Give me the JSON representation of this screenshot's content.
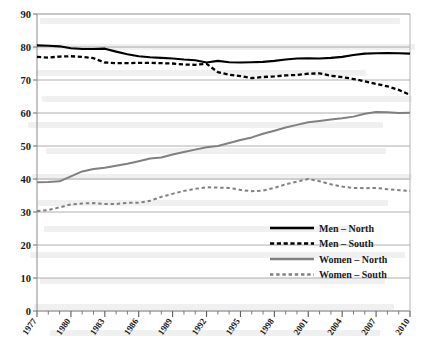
{
  "chart_data": {
    "type": "line",
    "title": "",
    "xlabel": "",
    "ylabel": "",
    "xlim": [
      1977,
      2010
    ],
    "ylim": [
      0,
      90
    ],
    "y_ticks": [
      0,
      10,
      20,
      30,
      40,
      50,
      60,
      70,
      80,
      90
    ],
    "y_tick_labels": [
      "0",
      "10",
      "20",
      "30",
      "40",
      "50",
      "60",
      "70",
      "80",
      "90"
    ],
    "x_ticks": [
      1977,
      1978,
      1979,
      1980,
      1981,
      1982,
      1983,
      1984,
      1985,
      1986,
      1987,
      1988,
      1989,
      1990,
      1991,
      1992,
      1993,
      1994,
      1995,
      1996,
      1997,
      1998,
      1999,
      2000,
      2001,
      2002,
      2003,
      2004,
      2005,
      2006,
      2007,
      2008,
      2009,
      2010
    ],
    "x_tick_labels": [
      "1977",
      "1980",
      "1983",
      "1986",
      "1989",
      "1992",
      "1995",
      "1998",
      "2001",
      "2004",
      "2007",
      "2010"
    ],
    "x_tick_label_years": [
      1977,
      1980,
      1983,
      1986,
      1989,
      1992,
      1995,
      1998,
      2001,
      2004,
      2007,
      2010
    ],
    "grid": "horizontal",
    "legend_position": "center-right",
    "x": [
      1977,
      1978,
      1979,
      1980,
      1981,
      1982,
      1983,
      1984,
      1985,
      1986,
      1987,
      1988,
      1989,
      1990,
      1991,
      1992,
      1993,
      1994,
      1995,
      1996,
      1997,
      1998,
      1999,
      2000,
      2001,
      2002,
      2003,
      2004,
      2005,
      2006,
      2007,
      2008,
      2009,
      2010
    ],
    "series": [
      {
        "name": "Men – North",
        "style": "solid",
        "color": "#000000",
        "width": 2.1,
        "values": [
          80.5,
          80.4,
          80.2,
          79.6,
          79.4,
          79.4,
          79.5,
          78.6,
          77.8,
          77.2,
          76.9,
          76.7,
          76.5,
          76.2,
          76.0,
          75.3,
          75.8,
          75.4,
          75.3,
          75.4,
          75.5,
          75.8,
          76.2,
          76.5,
          76.6,
          76.5,
          76.7,
          77.0,
          77.6,
          78.0,
          78.1,
          78.2,
          78.1,
          78.0
        ]
      },
      {
        "name": "Men – South",
        "style": "dashed",
        "color": "#000000",
        "width": 2.3,
        "values": [
          77.0,
          76.8,
          77.1,
          77.2,
          77.0,
          76.6,
          75.3,
          75.1,
          75.1,
          75.2,
          75.2,
          75.1,
          75.0,
          74.7,
          74.6,
          74.9,
          72.4,
          71.6,
          71.2,
          70.6,
          70.9,
          71.1,
          71.4,
          71.5,
          71.9,
          72.0,
          71.3,
          70.9,
          70.3,
          69.6,
          68.8,
          68.1,
          67.0,
          65.5
        ]
      },
      {
        "name": "Women – North",
        "style": "solid",
        "color": "#808080",
        "width": 2.0,
        "values": [
          39.0,
          39.1,
          39.3,
          40.8,
          42.3,
          43.0,
          43.4,
          44.0,
          44.6,
          45.4,
          46.2,
          46.5,
          47.4,
          48.2,
          48.9,
          49.6,
          50.0,
          50.9,
          51.8,
          52.6,
          53.7,
          54.6,
          55.6,
          56.4,
          57.2,
          57.6,
          58.0,
          58.4,
          58.9,
          59.8,
          60.3,
          60.2,
          60.0,
          60.1
        ]
      },
      {
        "name": "Women – South",
        "style": "dashed",
        "color": "#808080",
        "width": 2.0,
        "values": [
          30.3,
          30.6,
          31.4,
          32.3,
          32.6,
          32.7,
          32.4,
          32.4,
          32.8,
          32.8,
          33.4,
          34.6,
          35.5,
          36.4,
          37.0,
          37.5,
          37.4,
          37.3,
          36.7,
          36.3,
          36.5,
          37.3,
          38.4,
          39.2,
          40.0,
          39.3,
          38.4,
          37.7,
          37.3,
          37.2,
          37.3,
          36.9,
          36.6,
          36.4
        ]
      }
    ]
  },
  "legend": {
    "entries": [
      {
        "label": "Men – North"
      },
      {
        "label": "Men – South"
      },
      {
        "label": "Women – North"
      },
      {
        "label": "Women – South"
      }
    ]
  },
  "colors": {
    "men": "#000000",
    "women": "#808080",
    "grid": "#9a9a9a",
    "axis": "#6e6e6e",
    "background": "#ffffff"
  }
}
